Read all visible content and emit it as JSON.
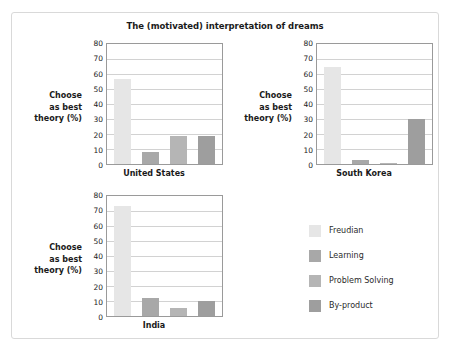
{
  "chart_data": {
    "type": "bar",
    "title": "The (motivated) interpretation of dreams",
    "xlabel": "",
    "ylabel": "Choose as best theory (%)",
    "ylim": [
      0,
      80
    ],
    "yticks": [
      0,
      10,
      20,
      30,
      40,
      50,
      60,
      70,
      80
    ],
    "grid": true,
    "legend_position": "right",
    "categories": [
      "Freudian",
      "Learning",
      "Problem Solving",
      "By-product"
    ],
    "panels": [
      {
        "name": "United States",
        "values": [
          57,
          8,
          18.5,
          18.5
        ]
      },
      {
        "name": "South Korea",
        "values": [
          64.5,
          2.5,
          1,
          30
        ]
      },
      {
        "name": "India",
        "values": [
          73.5,
          12,
          5.5,
          10
        ]
      }
    ],
    "series_colors": [
      "#e6e6e6",
      "#a8a8a8",
      "#b5b5b5",
      "#9e9e9e"
    ]
  },
  "figure": {
    "title": "The (motivated) interpretation of dreams",
    "axis_label_line1": "Choose",
    "axis_label_line2": "as best",
    "axis_label_line3": "theory (%)"
  },
  "panels": {
    "us": {
      "label": "United States",
      "ticks": [
        "80",
        "70",
        "60",
        "50",
        "40",
        "30",
        "20",
        "10",
        "0"
      ]
    },
    "kr": {
      "label": "South Korea",
      "ticks": [
        "80",
        "70",
        "60",
        "50",
        "40",
        "30",
        "20",
        "10",
        "0"
      ]
    },
    "in": {
      "label": "India",
      "ticks": [
        "80",
        "70",
        "60",
        "50",
        "40",
        "30",
        "20",
        "10",
        "0"
      ]
    }
  },
  "legend": {
    "items": [
      {
        "label": "Freudian",
        "color": "#e6e6e6"
      },
      {
        "label": "Learning",
        "color": "#a8a8a8"
      },
      {
        "label": "Problem Solving",
        "color": "#b5b5b5"
      },
      {
        "label": "By-product",
        "color": "#9e9e9e"
      }
    ]
  }
}
